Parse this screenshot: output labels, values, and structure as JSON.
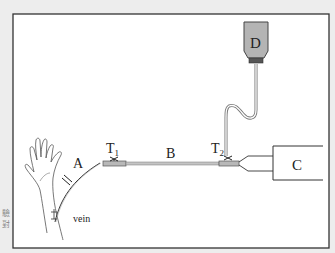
{
  "diagram": {
    "labels": {
      "A": "A",
      "B": "B",
      "C": "C",
      "D": "D",
      "T1_main": "T",
      "T1_sub": "1",
      "T2_main": "T",
      "T2_sub": "2",
      "vein": "vein"
    },
    "side_text": [
      "驗",
      "對"
    ],
    "colors": {
      "frame": "#333333",
      "tube": "#9a9a9a",
      "bag": "#b4b4b4",
      "background": "#ffffff"
    }
  }
}
